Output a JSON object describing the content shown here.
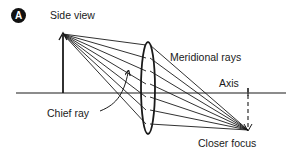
{
  "figure": {
    "panel_badge": "A",
    "title": "Side view"
  },
  "labels": {
    "meridional_rays": "Meridional rays",
    "axis": "Axis",
    "chief_ray": "Chief ray",
    "closer_focus": "Closer focus"
  },
  "geometry": {
    "axis": {
      "x1": 16,
      "x2": 286,
      "y": 93
    },
    "object_arrow": {
      "x": 63,
      "y_base": 93,
      "y_tip": 34
    },
    "lens": {
      "cx": 148,
      "cy": 88,
      "rx": 7,
      "ry": 46
    },
    "focus_point": {
      "x": 248,
      "y": 130
    },
    "ray_lens_heights": [
      45,
      58,
      71,
      84,
      97,
      110,
      124
    ],
    "stroke_color": "#1a1a1a"
  }
}
